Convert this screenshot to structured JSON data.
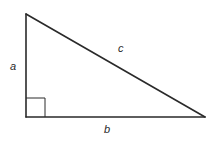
{
  "diagram": {
    "type": "right-triangle",
    "colors": {
      "stroke": "#2a2a2a",
      "background": "#ffffff"
    },
    "vertices": {
      "top": [
        26,
        14
      ],
      "right_angle": [
        26,
        117
      ],
      "right": [
        205,
        117
      ]
    },
    "right_angle_marker": {
      "size": 19
    },
    "labels": {
      "a": "a",
      "b": "b",
      "c": "c"
    },
    "label_positions": {
      "a": [
        10,
        70
      ],
      "b": [
        104,
        133
      ],
      "c": [
        118,
        52
      ]
    }
  }
}
